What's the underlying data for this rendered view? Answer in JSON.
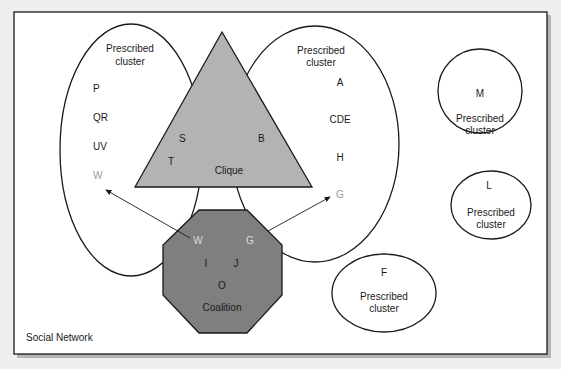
{
  "title": "Social Network",
  "frame": {
    "label": "Social Network"
  },
  "colors": {
    "background": "#efefed",
    "frame_fill": "#ffffff",
    "stroke": "#1a1a1a",
    "clique_fill": "#b3b3b3",
    "coalition_fill": "#7f7f7f",
    "muted_text": "#9a9a9a",
    "light_text": "#dcdcdc"
  },
  "clusters": {
    "left": {
      "title_line1": "Prescribed",
      "title_line2": "cluster",
      "members": [
        "P",
        "QR",
        "UV",
        "W"
      ]
    },
    "middle": {
      "title_line1": "Prescribed",
      "title_line2": "cluster",
      "members": [
        "A",
        "CDE",
        "H",
        "G"
      ]
    },
    "m": {
      "member": "M",
      "title_line1": "Prescribed",
      "title_line2": "cluster"
    },
    "l": {
      "member": "L",
      "title_line1": "Prescribed",
      "title_line2": "cluster"
    },
    "f": {
      "member": "F",
      "title_line1": "Prescribed",
      "title_line2": "cluster"
    }
  },
  "clique": {
    "label": "Clique",
    "members": [
      "S",
      "B",
      "T"
    ]
  },
  "coalition": {
    "label": "Coalition",
    "members": [
      "W",
      "G",
      "I",
      "J",
      "O"
    ]
  },
  "arrows": [
    {
      "from": "Coalition.W",
      "to": "LeftCluster.W"
    },
    {
      "from": "Coalition.G",
      "to": "MiddleCluster.G"
    }
  ]
}
